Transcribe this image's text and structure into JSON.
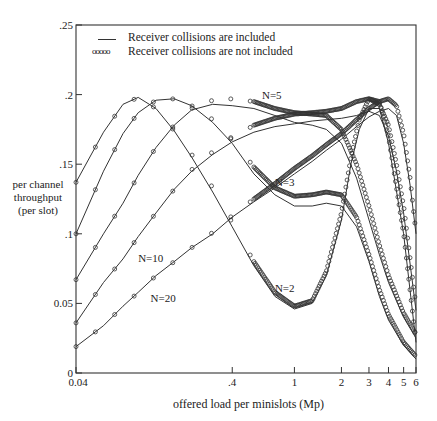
{
  "chart_data": {
    "type": "line",
    "title": "",
    "xlabel": "offered load per minislots (Mp)",
    "ylabel": "per channel throughput (per slot)",
    "xscale": "log",
    "xlim": [
      0.04,
      6
    ],
    "ylim": [
      0,
      0.25
    ],
    "xticks": [
      0.04,
      0.4,
      1,
      2,
      3,
      4,
      5,
      6
    ],
    "xtick_labels": [
      "0.04",
      ".4",
      "1",
      "2",
      "3",
      "4",
      "5",
      "6"
    ],
    "yticks": [
      0,
      0.05,
      0.1,
      0.15,
      0.2,
      0.25
    ],
    "ytick_labels": [
      "0",
      "0.05",
      ".1",
      ".15",
      ".2",
      ".25"
    ],
    "legend": [
      {
        "label": "Receiver collisions are included",
        "style": "solid line"
      },
      {
        "label": "Receiver collisions are not included",
        "style": "circles"
      }
    ],
    "annotations": [
      {
        "text": "N=2",
        "x": 0.75,
        "y": 0.058
      },
      {
        "text": "N=3",
        "x": 0.75,
        "y": 0.134
      },
      {
        "text": "N=5",
        "x": 0.62,
        "y": 0.197
      },
      {
        "text": "N=10",
        "x": 0.1,
        "y": 0.08
      },
      {
        "text": "N=20",
        "x": 0.12,
        "y": 0.051
      }
    ],
    "series": [
      {
        "name": "N=2",
        "x": [
          0.04,
          0.06,
          0.08,
          0.1,
          0.13,
          0.17,
          0.22,
          0.3,
          0.4,
          0.55,
          0.75,
          1.0,
          1.3,
          1.6,
          2.0,
          2.3,
          2.6,
          3.0,
          3.5,
          4.0,
          5.0,
          6.0
        ],
        "y_included": [
          0.137,
          0.173,
          0.193,
          0.198,
          0.19,
          0.174,
          0.155,
          0.13,
          0.105,
          0.077,
          0.055,
          0.046,
          0.05,
          0.07,
          0.11,
          0.15,
          0.175,
          0.19,
          0.19,
          0.165,
          0.1,
          0.022
        ],
        "y_not_included": [
          0.137,
          0.173,
          0.193,
          0.198,
          0.19,
          0.174,
          0.157,
          0.133,
          0.108,
          0.08,
          0.058,
          0.048,
          0.052,
          0.073,
          0.115,
          0.155,
          0.182,
          0.197,
          0.195,
          0.17,
          0.1,
          0.022
        ]
      },
      {
        "name": "N=3",
        "x": [
          0.04,
          0.06,
          0.08,
          0.1,
          0.13,
          0.17,
          0.22,
          0.3,
          0.4,
          0.55,
          0.75,
          1.0,
          1.3,
          1.6,
          2.0,
          2.5,
          3.0,
          3.5,
          4.0,
          5.0,
          6.0
        ],
        "y_included": [
          0.1,
          0.145,
          0.172,
          0.187,
          0.196,
          0.197,
          0.192,
          0.18,
          0.165,
          0.143,
          0.128,
          0.12,
          0.12,
          0.122,
          0.12,
          0.105,
          0.08,
          0.055,
          0.038,
          0.02,
          0.01
        ],
        "y_not_included": [
          0.1,
          0.145,
          0.172,
          0.187,
          0.196,
          0.197,
          0.192,
          0.182,
          0.168,
          0.148,
          0.133,
          0.127,
          0.128,
          0.13,
          0.128,
          0.112,
          0.085,
          0.06,
          0.042,
          0.022,
          0.012
        ]
      },
      {
        "name": "N=5",
        "x": [
          0.04,
          0.06,
          0.08,
          0.1,
          0.13,
          0.17,
          0.22,
          0.3,
          0.4,
          0.55,
          0.75,
          1.0,
          1.3,
          1.6,
          2.0,
          2.5,
          3.0,
          3.5,
          4.0,
          5.0,
          6.0
        ],
        "y_included": [
          0.067,
          0.1,
          0.122,
          0.142,
          0.162,
          0.178,
          0.189,
          0.193,
          0.192,
          0.19,
          0.185,
          0.18,
          0.178,
          0.175,
          0.165,
          0.14,
          0.11,
          0.085,
          0.065,
          0.04,
          0.025
        ],
        "y_not_included": [
          0.067,
          0.1,
          0.122,
          0.142,
          0.162,
          0.178,
          0.19,
          0.196,
          0.197,
          0.195,
          0.19,
          0.187,
          0.186,
          0.185,
          0.175,
          0.15,
          0.12,
          0.092,
          0.07,
          0.043,
          0.028
        ]
      },
      {
        "name": "N=10",
        "x": [
          0.04,
          0.06,
          0.08,
          0.1,
          0.13,
          0.17,
          0.22,
          0.3,
          0.4,
          0.55,
          0.75,
          1.0,
          1.3,
          1.6,
          2.0,
          2.5,
          3.0,
          3.5,
          4.0,
          4.5,
          5.0,
          6.0
        ],
        "y_included": [
          0.036,
          0.065,
          0.082,
          0.098,
          0.115,
          0.132,
          0.145,
          0.157,
          0.166,
          0.173,
          0.177,
          0.179,
          0.181,
          0.182,
          0.183,
          0.185,
          0.188,
          0.185,
          0.17,
          0.145,
          0.115,
          0.045
        ],
        "y_not_included": [
          0.036,
          0.065,
          0.082,
          0.098,
          0.115,
          0.132,
          0.146,
          0.159,
          0.169,
          0.178,
          0.183,
          0.186,
          0.187,
          0.188,
          0.19,
          0.195,
          0.197,
          0.193,
          0.178,
          0.15,
          0.12,
          0.048
        ]
      },
      {
        "name": "N=20",
        "x": [
          0.04,
          0.06,
          0.08,
          0.1,
          0.13,
          0.17,
          0.22,
          0.3,
          0.4,
          0.55,
          0.75,
          1.0,
          1.3,
          1.6,
          2.0,
          2.5,
          3.0,
          3.5,
          4.0,
          4.5,
          5.0,
          5.5,
          6.0
        ],
        "y_included": [
          0.019,
          0.034,
          0.048,
          0.058,
          0.07,
          0.08,
          0.09,
          0.1,
          0.112,
          0.123,
          0.133,
          0.143,
          0.152,
          0.16,
          0.168,
          0.177,
          0.184,
          0.188,
          0.19,
          0.185,
          0.165,
          0.135,
          0.1
        ],
        "y_not_included": [
          0.019,
          0.034,
          0.048,
          0.058,
          0.07,
          0.08,
          0.09,
          0.101,
          0.113,
          0.125,
          0.136,
          0.147,
          0.156,
          0.164,
          0.172,
          0.182,
          0.19,
          0.195,
          0.197,
          0.192,
          0.172,
          0.14,
          0.1
        ]
      }
    ]
  },
  "ui": {
    "legend_solid_label": "Receiver collisions are included",
    "legend_circle_label": "Receiver collisions are not included",
    "legend_circle_glyph": "ooooo",
    "ylabel_line1": "per channel",
    "ylabel_line2": "throughput",
    "ylabel_line3": "(per slot)",
    "xlabel": "offered load per minislots (Mp)"
  }
}
